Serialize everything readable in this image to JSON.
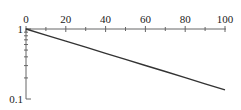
{
  "chart_data": {
    "type": "line",
    "title": "",
    "xlabel": "",
    "ylabel": "",
    "y_scale": "log",
    "xlim": [
      0,
      100
    ],
    "ylim": [
      0.1,
      1
    ],
    "grid": false,
    "legend": null,
    "x_ticks": [
      0,
      20,
      40,
      60,
      80,
      100
    ],
    "x_tick_labels": [
      "0",
      "20",
      "40",
      "60",
      "80",
      "100"
    ],
    "y_ticks": [
      0.1,
      1
    ],
    "y_tick_labels": [
      "0.1",
      "1"
    ],
    "series": [
      {
        "name": "curve",
        "color": "#333333",
        "x": [
          0,
          10,
          20,
          30,
          40,
          50,
          60,
          70,
          80,
          90,
          100
        ],
        "y": [
          1.0,
          0.819,
          0.67,
          0.549,
          0.449,
          0.368,
          0.301,
          0.247,
          0.202,
          0.165,
          0.135
        ]
      }
    ]
  }
}
